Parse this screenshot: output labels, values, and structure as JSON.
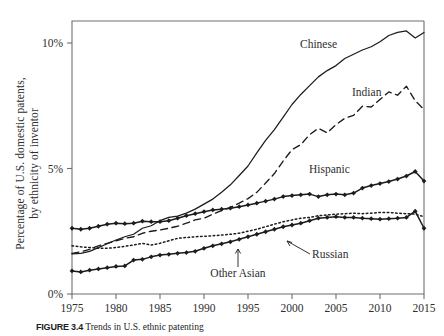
{
  "figure": {
    "caption_number": "FIGURE 3.4",
    "caption_text": "Trends in U.S. ethnic patenting"
  },
  "axes": {
    "ylabel_line1": "Percentage of U.S. domestic patents,",
    "ylabel_line2": "by ethnicity of inventor",
    "xlabel": "",
    "yticks": [
      "0%",
      "5%",
      "10%"
    ],
    "xticks": [
      "1975",
      "1980",
      "1985",
      "1990",
      "1995",
      "2000",
      "2005",
      "2010",
      "2015"
    ]
  },
  "annotations": [
    {
      "name": "chinese",
      "text": "Chinese"
    },
    {
      "name": "indian",
      "text": "Indian"
    },
    {
      "name": "hispanic",
      "text": "Hispanic"
    },
    {
      "name": "russian",
      "text": "Russian"
    },
    {
      "name": "other-asian",
      "text": "Other Asian"
    }
  ],
  "chart_data": {
    "type": "line",
    "title": "Trends in U.S. ethnic patenting",
    "xlabel": "",
    "ylabel": "Percentage of U.S. domestic patents, by ethnicity of inventor",
    "xlim": [
      1975,
      2015
    ],
    "ylim": [
      0,
      11.2
    ],
    "yticks": [
      0,
      5,
      10
    ],
    "xticks": [
      1975,
      1980,
      1985,
      1990,
      1995,
      2000,
      2005,
      2010,
      2015
    ],
    "ytick_labels": [
      "0%",
      "5%",
      "10%"
    ],
    "grid": false,
    "legend": "inline-annotations",
    "x": [
      1975,
      1976,
      1977,
      1978,
      1979,
      1980,
      1981,
      1982,
      1983,
      1984,
      1985,
      1986,
      1987,
      1988,
      1989,
      1990,
      1991,
      1992,
      1993,
      1994,
      1995,
      1996,
      1997,
      1998,
      1999,
      2000,
      2001,
      2002,
      2003,
      2004,
      2005,
      2006,
      2007,
      2008,
      2009,
      2010,
      2011,
      2012,
      2013,
      2014,
      2015
    ],
    "series": [
      {
        "name": "Chinese",
        "style": "solid-thin",
        "values": [
          1.6,
          1.62,
          1.7,
          1.85,
          2.0,
          2.15,
          2.28,
          2.38,
          2.62,
          2.72,
          2.92,
          3.05,
          3.1,
          3.22,
          3.38,
          3.58,
          3.78,
          4.05,
          4.35,
          4.72,
          5.1,
          5.62,
          6.12,
          6.55,
          7.05,
          7.55,
          7.95,
          8.3,
          8.65,
          8.9,
          9.1,
          9.38,
          9.55,
          9.72,
          9.85,
          10.05,
          10.3,
          10.42,
          10.48,
          10.2,
          10.42
        ]
      },
      {
        "name": "Indian",
        "style": "dashed",
        "values": [
          1.62,
          1.68,
          1.78,
          1.92,
          2.02,
          2.12,
          2.22,
          2.28,
          2.42,
          2.5,
          2.55,
          2.62,
          2.7,
          2.82,
          2.95,
          3.02,
          3.18,
          3.32,
          3.45,
          3.62,
          3.8,
          4.05,
          4.42,
          4.8,
          5.3,
          5.75,
          5.95,
          6.35,
          6.6,
          6.42,
          6.75,
          7.0,
          7.12,
          7.48,
          7.45,
          7.75,
          8.05,
          7.92,
          8.28,
          7.7,
          7.35
        ]
      },
      {
        "name": "Hispanic",
        "style": "marked",
        "values": [
          2.62,
          2.58,
          2.62,
          2.7,
          2.78,
          2.82,
          2.8,
          2.82,
          2.9,
          2.88,
          2.88,
          2.92,
          3.02,
          3.12,
          3.2,
          3.28,
          3.35,
          3.38,
          3.42,
          3.48,
          3.55,
          3.62,
          3.7,
          3.78,
          3.88,
          3.92,
          3.95,
          3.98,
          3.88,
          3.95,
          3.98,
          3.95,
          4.02,
          4.22,
          4.32,
          4.4,
          4.48,
          4.58,
          4.7,
          4.88,
          4.5
        ]
      },
      {
        "name": "Russian",
        "style": "dotted",
        "values": [
          1.92,
          1.88,
          1.85,
          1.82,
          1.82,
          1.85,
          1.9,
          1.95,
          2.02,
          1.95,
          2.02,
          2.12,
          2.22,
          2.25,
          2.28,
          2.3,
          2.32,
          2.35,
          2.38,
          2.42,
          2.5,
          2.58,
          2.68,
          2.78,
          2.88,
          2.95,
          3.02,
          3.05,
          3.12,
          3.15,
          3.18,
          3.2,
          3.22,
          3.2,
          3.22,
          3.25,
          3.25,
          3.22,
          3.2,
          3.18,
          3.08
        ]
      },
      {
        "name": "Other Asian",
        "style": "marked",
        "values": [
          0.92,
          0.88,
          0.95,
          1.0,
          1.05,
          1.1,
          1.12,
          1.35,
          1.38,
          1.48,
          1.55,
          1.58,
          1.62,
          1.65,
          1.7,
          1.82,
          1.92,
          2.0,
          2.08,
          2.18,
          2.28,
          2.38,
          2.48,
          2.58,
          2.68,
          2.75,
          2.82,
          2.92,
          3.02,
          3.05,
          3.08,
          3.05,
          3.05,
          3.02,
          3.0,
          2.98,
          3.0,
          3.02,
          3.05,
          3.3,
          2.62
        ]
      }
    ]
  }
}
